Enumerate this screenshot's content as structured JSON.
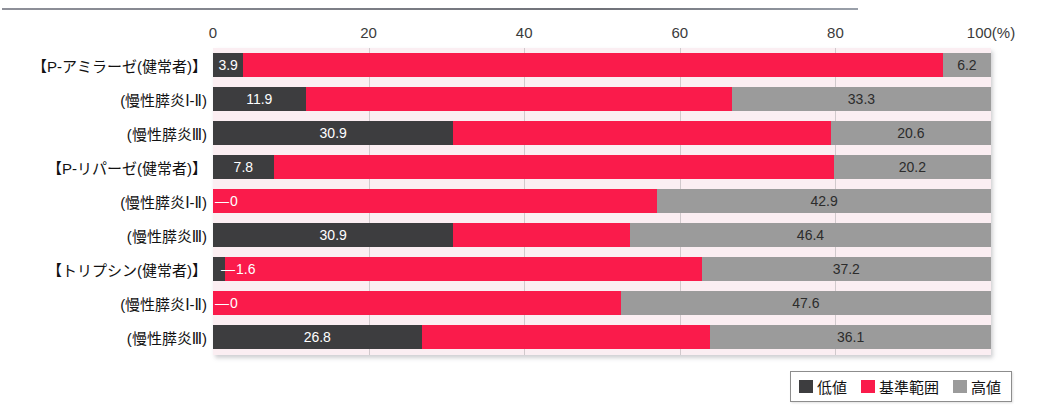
{
  "chart_data": {
    "type": "bar",
    "orientation": "horizontal",
    "stacked": true,
    "title": "",
    "xlabel": "",
    "ylabel": "",
    "xlim": [
      0,
      100
    ],
    "axis_unit": "(%)",
    "grid": true,
    "legend_position": "bottom-right",
    "xticks": [
      {
        "value": 0,
        "label": "0"
      },
      {
        "value": 20,
        "label": "20"
      },
      {
        "value": 40,
        "label": "40"
      },
      {
        "value": 60,
        "label": "60"
      },
      {
        "value": 80,
        "label": "80"
      },
      {
        "value": 100,
        "label": "100(%)"
      }
    ],
    "series": [
      {
        "name": "低値",
        "color": "#3d3d3f",
        "values": [
          3.9,
          11.9,
          30.9,
          7.8,
          0,
          30.9,
          1.6,
          0,
          26.8
        ]
      },
      {
        "name": "基準範囲",
        "color": "#fa1b4b",
        "values": [
          89.9,
          54.8,
          48.5,
          72.0,
          57.1,
          22.7,
          61.2,
          52.4,
          37.1
        ]
      },
      {
        "name": "高値",
        "color": "#9b9b9b",
        "values": [
          6.2,
          33.3,
          20.6,
          20.2,
          42.9,
          46.4,
          37.2,
          47.6,
          36.1
        ]
      }
    ],
    "categories": [
      "【P-アミラーゼ(健常者)】",
      "(慢性膵炎Ⅰ-Ⅱ)",
      "(慢性膵炎Ⅲ)",
      "【P-リパーゼ(健常者)】",
      "(慢性膵炎Ⅰ-Ⅱ)",
      "(慢性膵炎Ⅲ)",
      "【トリプシン(健常者)】",
      "(慢性膵炎Ⅰ-Ⅱ)",
      "(慢性膵炎Ⅲ)"
    ],
    "rows": [
      {
        "category": "【P-アミラーゼ(健常者)】",
        "segments": [
          {
            "series": "低値",
            "value": 3.9,
            "label": "3.9",
            "label_shown": true,
            "label_placement": "inside"
          },
          {
            "series": "基準範囲",
            "value": 89.9,
            "label": "",
            "label_shown": false,
            "label_placement": "none"
          },
          {
            "series": "高値",
            "value": 6.2,
            "label": "6.2",
            "label_shown": true,
            "label_placement": "inside"
          }
        ]
      },
      {
        "category": "(慢性膵炎Ⅰ-Ⅱ)",
        "segments": [
          {
            "series": "低値",
            "value": 11.9,
            "label": "11.9",
            "label_shown": true,
            "label_placement": "inside"
          },
          {
            "series": "基準範囲",
            "value": 54.8,
            "label": "",
            "label_shown": false,
            "label_placement": "none"
          },
          {
            "series": "高値",
            "value": 33.3,
            "label": "33.3",
            "label_shown": true,
            "label_placement": "inside"
          }
        ]
      },
      {
        "category": "(慢性膵炎Ⅲ)",
        "segments": [
          {
            "series": "低値",
            "value": 30.9,
            "label": "30.9",
            "label_shown": true,
            "label_placement": "inside"
          },
          {
            "series": "基準範囲",
            "value": 48.5,
            "label": "",
            "label_shown": false,
            "label_placement": "none"
          },
          {
            "series": "高値",
            "value": 20.6,
            "label": "20.6",
            "label_shown": true,
            "label_placement": "inside"
          }
        ]
      },
      {
        "category": "【P-リパーゼ(健常者)】",
        "segments": [
          {
            "series": "低値",
            "value": 7.8,
            "label": "7.8",
            "label_shown": true,
            "label_placement": "inside"
          },
          {
            "series": "基準範囲",
            "value": 72.0,
            "label": "",
            "label_shown": false,
            "label_placement": "none"
          },
          {
            "series": "高値",
            "value": 20.2,
            "label": "20.2",
            "label_shown": true,
            "label_placement": "inside"
          }
        ]
      },
      {
        "category": "(慢性膵炎Ⅰ-Ⅱ)",
        "segments": [
          {
            "series": "低値",
            "value": 0,
            "label": "0",
            "label_shown": true,
            "label_placement": "leader"
          },
          {
            "series": "基準範囲",
            "value": 57.1,
            "label": "",
            "label_shown": false,
            "label_placement": "none"
          },
          {
            "series": "高値",
            "value": 42.9,
            "label": "42.9",
            "label_shown": true,
            "label_placement": "inside"
          }
        ]
      },
      {
        "category": "(慢性膵炎Ⅲ)",
        "segments": [
          {
            "series": "低値",
            "value": 30.9,
            "label": "30.9",
            "label_shown": true,
            "label_placement": "inside"
          },
          {
            "series": "基準範囲",
            "value": 22.7,
            "label": "",
            "label_shown": false,
            "label_placement": "none"
          },
          {
            "series": "高値",
            "value": 46.4,
            "label": "46.4",
            "label_shown": true,
            "label_placement": "inside"
          }
        ]
      },
      {
        "category": "【トリプシン(健常者)】",
        "segments": [
          {
            "series": "低値",
            "value": 1.6,
            "label": "1.6",
            "label_shown": true,
            "label_placement": "leader"
          },
          {
            "series": "基準範囲",
            "value": 61.2,
            "label": "",
            "label_shown": false,
            "label_placement": "none"
          },
          {
            "series": "高値",
            "value": 37.2,
            "label": "37.2",
            "label_shown": true,
            "label_placement": "inside"
          }
        ]
      },
      {
        "category": "(慢性膵炎Ⅰ-Ⅱ)",
        "segments": [
          {
            "series": "低値",
            "value": 0,
            "label": "0",
            "label_shown": true,
            "label_placement": "leader"
          },
          {
            "series": "基準範囲",
            "value": 52.4,
            "label": "",
            "label_shown": false,
            "label_placement": "none"
          },
          {
            "series": "高値",
            "value": 47.6,
            "label": "47.6",
            "label_shown": true,
            "label_placement": "inside"
          }
        ]
      },
      {
        "category": "(慢性膵炎Ⅲ)",
        "segments": [
          {
            "series": "低値",
            "value": 26.8,
            "label": "26.8",
            "label_shown": true,
            "label_placement": "inside"
          },
          {
            "series": "基準範囲",
            "value": 37.1,
            "label": "",
            "label_shown": false,
            "label_placement": "none"
          },
          {
            "series": "高値",
            "value": 36.1,
            "label": "36.1",
            "label_shown": true,
            "label_placement": "inside"
          }
        ]
      }
    ],
    "legend": [
      {
        "label": "低値",
        "color": "#3d3d3f"
      },
      {
        "label": "基準範囲",
        "color": "#fa1b4b"
      },
      {
        "label": "高値",
        "color": "#9b9b9b"
      }
    ]
  },
  "colors": {
    "low": "#3d3d3f",
    "reference": "#fa1b4b",
    "high": "#9b9b9b",
    "plot_background": "#fbeef2",
    "gridline": "#c9c2c6"
  }
}
